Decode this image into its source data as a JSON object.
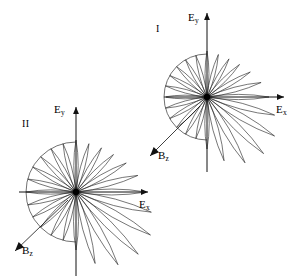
{
  "figure": {
    "type": "polar-lobe-diagram",
    "background_color": "#ffffff",
    "ink_color": "#000000",
    "panel_count": 2,
    "caption_present": false
  },
  "panels": [
    {
      "id": "panel-1",
      "roman_label": "I",
      "roman_label_pos": [
        156,
        24
      ],
      "center": [
        207,
        97
      ],
      "axes": {
        "x_axis_label": "E",
        "x_axis_subscript": "x",
        "x_axis_label_pos": [
          276,
          104
        ],
        "y_axis_label": "E",
        "y_axis_subscript": "y",
        "y_axis_label_pos": [
          188,
          12
        ],
        "x_left_end": 166,
        "x_right_end": 284,
        "y_top_end": 13,
        "y_bottom_end": 172,
        "x_arrow": "right",
        "y_arrow": "up"
      },
      "b_field": {
        "label": "B",
        "subscript": "z",
        "label_pos": [
          158,
          150
        ],
        "tail": [
          200,
          106
        ],
        "tip": [
          150,
          156
        ],
        "direction_deg": 225
      },
      "arc": {
        "radius": 43,
        "start_deg": 90,
        "end_deg": 270,
        "side": "left"
      },
      "lobes": {
        "count": 24,
        "angle_step_deg": 15,
        "left_half_radius": 43,
        "right_half_radius_min": 44,
        "right_half_radius_max": 80,
        "width_ratio": 0.085,
        "shape": "needle-petal"
      }
    },
    {
      "id": "panel-2",
      "roman_label": "II",
      "roman_label_pos": [
        22,
        119
      ],
      "center": [
        76,
        192
      ],
      "axes": {
        "x_axis_label": "E",
        "x_axis_subscript": "x",
        "x_axis_label_pos": [
          139,
          199
        ],
        "y_axis_label": "E",
        "y_axis_subscript": "y",
        "y_axis_label_pos": [
          54,
          104
        ],
        "x_left_end": 19,
        "x_right_end": 148,
        "y_top_end": 107,
        "y_bottom_end": 276,
        "x_arrow": "right",
        "y_arrow": "up"
      },
      "b_field": {
        "label": "B",
        "subscript": "z",
        "label_pos": [
          22,
          245
        ],
        "tail": [
          68,
          200
        ],
        "tip": [
          15,
          251
        ],
        "direction_deg": 225
      },
      "arc": {
        "radius": 50,
        "start_deg": 90,
        "end_deg": 270,
        "side": "left"
      },
      "lobes": {
        "count": 24,
        "angle_step_deg": 15,
        "left_half_radius": 50,
        "right_half_radius_min": 50,
        "right_half_radius_max": 88,
        "width_ratio": 0.085,
        "shape": "needle-petal"
      }
    }
  ],
  "chart_data": {
    "type": "scatter",
    "title": "",
    "xlabel": "E_x",
    "ylabel": "E_y",
    "grid": false,
    "legend": "none",
    "series": [
      {
        "name": "panel-I-lobe-lengths",
        "angles_deg": [
          0,
          15,
          30,
          45,
          60,
          75,
          90,
          105,
          120,
          135,
          150,
          165,
          180,
          195,
          210,
          225,
          240,
          255,
          270,
          285,
          300,
          315,
          330,
          345
        ],
        "values": [
          62,
          56,
          50,
          46,
          44,
          44,
          46,
          43,
          43,
          43,
          43,
          43,
          43,
          43,
          43,
          43,
          43,
          43,
          52,
          66,
          76,
          80,
          78,
          70
        ]
      },
      {
        "name": "panel-II-lobe-lengths",
        "angles_deg": [
          0,
          15,
          30,
          45,
          60,
          75,
          90,
          105,
          120,
          135,
          150,
          165,
          180,
          195,
          210,
          225,
          240,
          255,
          270,
          285,
          300,
          315,
          330,
          345
        ],
        "values": [
          70,
          64,
          58,
          53,
          51,
          50,
          52,
          50,
          50,
          50,
          50,
          50,
          50,
          50,
          50,
          50,
          50,
          50,
          58,
          74,
          84,
          88,
          86,
          78
        ]
      }
    ]
  }
}
